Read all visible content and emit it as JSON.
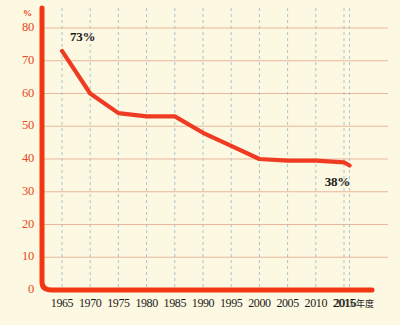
{
  "chart_data": {
    "type": "line",
    "title": "",
    "xlabel": "年度",
    "ylabel": "%",
    "yunit": "%",
    "x": [
      1965,
      1970,
      1975,
      1980,
      1985,
      1990,
      1995,
      2000,
      2005,
      2010,
      2015,
      2016
    ],
    "values": [
      73,
      60,
      54,
      53,
      53,
      48,
      44,
      40,
      39.5,
      39.5,
      39,
      38
    ],
    "categories": [
      "1965",
      "1970",
      "1975",
      "1980",
      "1985",
      "1990",
      "1995",
      "2000",
      "2005",
      "2010",
      "2015",
      "2016年度"
    ],
    "xtick_labels": [
      "1965",
      "1970",
      "1975",
      "1980",
      "1985",
      "1990",
      "1995",
      "2000",
      "2005",
      "2010",
      "2015"
    ],
    "xtick_last_number": "2016",
    "xtick_last_unit": "年度",
    "ytick_labels": [
      "80",
      "70",
      "60",
      "50",
      "40",
      "30",
      "20",
      "10",
      "0"
    ],
    "ytick_values": [
      80,
      70,
      60,
      50,
      40,
      30,
      20,
      10,
      0
    ],
    "ylim": [
      0,
      80
    ],
    "xlim": [
      1965,
      2016
    ],
    "grid": "both",
    "legend": "none",
    "annotations": [
      {
        "text": "73%",
        "x": 1965,
        "y": 73
      },
      {
        "text": "38%",
        "x": 2016,
        "y": 38
      }
    ],
    "series_color": "#ee3b22",
    "axis_color": "#f03712",
    "hgrid_color": "#eab79a",
    "vgrid_color": "#aac4cc",
    "background_color": "#fdf8e1",
    "text_color": "#1a1a1a"
  }
}
